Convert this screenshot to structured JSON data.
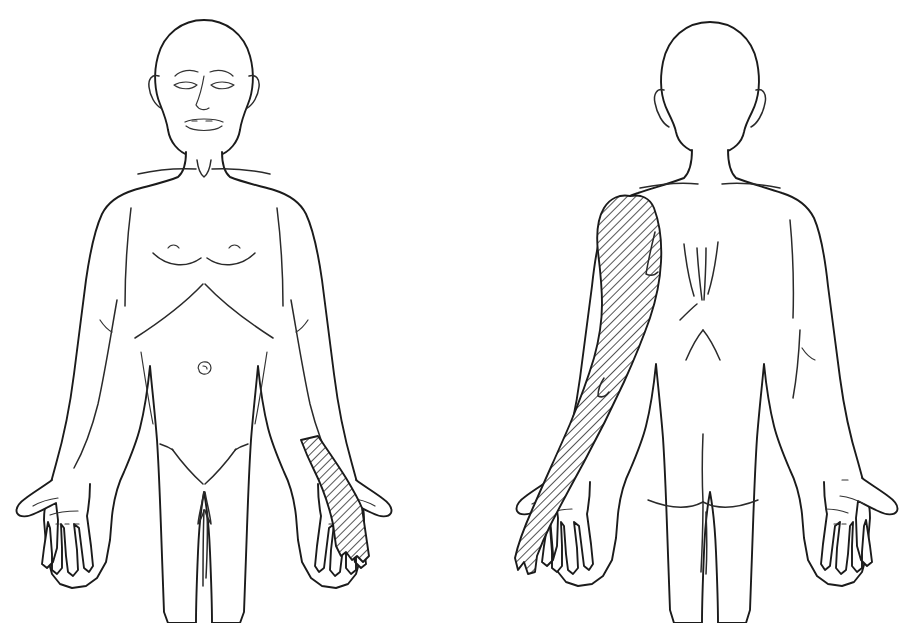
{
  "figure": {
    "background_color": "#ffffff",
    "line_color": "#1b1b1b",
    "hatch_color": "#1b1b1b",
    "caption": ""
  },
  "views": [
    {
      "id": "anterior",
      "label": "Anterior view",
      "sex_presentation": "male",
      "position": "left",
      "head": {
        "label": "Head, front",
        "features": [
          "bald scalp",
          "eyebrows",
          "closed eyes",
          "nose",
          "lips",
          "ears"
        ]
      },
      "landmarks": [
        "sternal notch",
        "clavicles",
        "pectoral folds",
        "nipples",
        "costal margin",
        "navel",
        "inguinal creases",
        "genital region"
      ],
      "shaded_regions": [
        {
          "name": "left-forearm-ulnar-strip",
          "side": "left",
          "body_part": "forearm and hand, ulnar border",
          "pattern": "diagonal-hatch",
          "extent": "mid-forearm to little and ring fingers",
          "description": "Narrow hatched strip along the ulnar (medial) border of the left forearm continuing onto the ulnar side of the hand and the fourth and fifth fingers."
        }
      ]
    },
    {
      "id": "posterior",
      "label": "Posterior view",
      "sex_presentation": "male",
      "position": "right",
      "head": {
        "label": "Head, back",
        "features": [
          "bald scalp",
          "ears",
          "nape of neck"
        ]
      },
      "landmarks": [
        "shoulder lines",
        "scapular borders",
        "spinal furrow",
        "lumbar dimples",
        "gluteal fold",
        "gluteal cleft"
      ],
      "shaded_regions": [
        {
          "name": "left-arm-posterior-full",
          "side": "left",
          "body_part": "entire posterior arm, forearm and hand",
          "pattern": "diagonal-hatch",
          "extent": "deltoid and shoulder down through arm, forearm, hand and fingers",
          "description": "Broad hatched region covering the posterior aspect of the whole left upper limb from the deltoid over the arm and forearm onto the dorsum of the hand and fingers."
        }
      ]
    }
  ],
  "legend": {
    "hatch_meaning": "Hatched area = affected / symptomatic region",
    "pattern_name": "diagonal-hatch"
  }
}
